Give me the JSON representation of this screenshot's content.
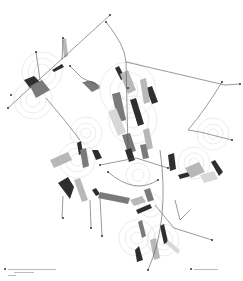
{
  "figure": {
    "type": "abstract architectural network diagram",
    "background": "#ffffff",
    "colors": {
      "line": "#555555",
      "line_light": "#999999",
      "circle": "#d6d6d6",
      "shape_dark": "#2e2e2e",
      "shape_mid": "#7a7a7a",
      "shape_light": "#b8b8b8",
      "shape_pale": "#d8d8d8",
      "dot": "#333333"
    }
  },
  "legend": {
    "left": {
      "marker": "square-marker",
      "lines": [
        "",
        "",
        ""
      ]
    },
    "right": {
      "marker": "square-marker",
      "lines": [
        ""
      ]
    }
  }
}
